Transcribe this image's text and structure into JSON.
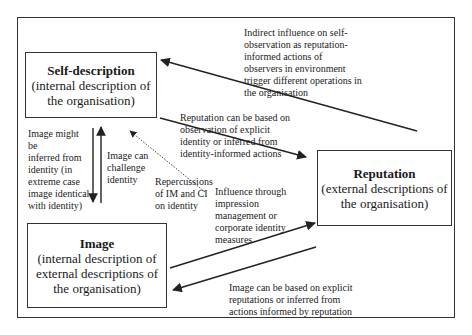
{
  "diagram": {
    "nodes": {
      "self_description": {
        "title": "Self-description",
        "desc": "(internal description of the organisation)"
      },
      "image": {
        "title": "Image",
        "desc": "(internal description of external descriptions of the organisation)"
      },
      "reputation": {
        "title": "Reputation",
        "desc": "(external descriptions of the organisation)"
      }
    },
    "edge_labels": {
      "indirect_influence": "Indirect influence on self-\nobservation as reputation-\ninformed actions of\nobservers in environment\ntrigger different operations in\nthe organisation",
      "reputation_based": "Reputation can be based on\nobservation of explicit\nidentity or inferred from\nidentity-informed actions",
      "image_inferred": "Image might be\ninferred from\nidentity (in\nextreme case\nimage identical\nwith identity)",
      "image_challenge": "Image can\nchallenge\nidentity",
      "repercussions": "Repercussions\nof IM and CI\non identity",
      "influence_through": "Influence through\nimpression\nmanagement or\ncorporate identity\nmeasures",
      "image_based": "Image can be based on explicit\nreputations or inferred from\nactions informed by reputation"
    },
    "edges": [
      {
        "from": "reputation",
        "to": "self_description",
        "style": "solid",
        "label": "indirect_influence"
      },
      {
        "from": "self_description",
        "to": "reputation",
        "style": "solid",
        "label": "reputation_based"
      },
      {
        "from": "self_description",
        "to": "image",
        "style": "solid",
        "label": "image_inferred"
      },
      {
        "from": "image",
        "to": "self_description",
        "style": "solid",
        "label": "image_challenge"
      },
      {
        "from": "image",
        "to": "self_description",
        "style": "dotted",
        "label": "repercussions"
      },
      {
        "from": "image",
        "to": "reputation",
        "style": "solid",
        "label": "influence_through"
      },
      {
        "from": "reputation",
        "to": "image",
        "style": "solid",
        "label": "image_based"
      }
    ],
    "colors": {
      "stroke": "#333333",
      "text": "#1a1a1a",
      "background": "#ffffff"
    }
  }
}
